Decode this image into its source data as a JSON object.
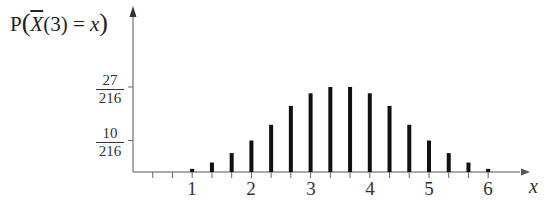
{
  "chart_data": {
    "type": "bar",
    "title": "",
    "ylabel": "P(X̄(3) = x)",
    "xlabel": "x",
    "x": [
      1,
      1.3333,
      1.6667,
      2,
      2.3333,
      2.6667,
      3,
      3.3333,
      3.6667,
      4,
      4.3333,
      4.6667,
      5,
      5.3333,
      5.6667,
      6
    ],
    "x_labels": [
      "1",
      "4/3",
      "5/3",
      "2",
      "7/3",
      "8/3",
      "3",
      "10/3",
      "11/3",
      "4",
      "13/3",
      "14/3",
      "5",
      "16/3",
      "17/3",
      "6"
    ],
    "numerators": [
      1,
      3,
      6,
      10,
      15,
      21,
      25,
      27,
      27,
      25,
      21,
      15,
      10,
      6,
      3,
      1
    ],
    "denominator": 216,
    "values": [
      0.00463,
      0.01389,
      0.02778,
      0.0463,
      0.06944,
      0.09722,
      0.11574,
      0.125,
      0.125,
      0.11574,
      0.09722,
      0.06944,
      0.0463,
      0.02778,
      0.01389,
      0.00463
    ],
    "x_ticks": [
      "1",
      "2",
      "3",
      "4",
      "5",
      "6"
    ],
    "y_ticks": [
      {
        "num": "10",
        "den": "216",
        "value": 0.0463
      },
      {
        "num": "27",
        "den": "216",
        "value": 0.125
      }
    ],
    "xlim": [
      0,
      6.67
    ],
    "ylim": [
      0,
      0.14
    ],
    "grid": false,
    "legend": null
  },
  "labels": {
    "y_prefix": "P",
    "y_var": "X",
    "y_arg": "(3) = ",
    "y_x": "x",
    "x_axis": "x"
  }
}
